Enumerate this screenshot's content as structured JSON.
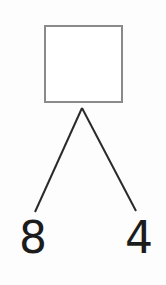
{
  "diagram": {
    "type": "number-bond",
    "whole": "",
    "parts": [
      "8",
      "4"
    ],
    "colors": {
      "box_border": "#8a8a8a",
      "lines": "#2a2a2a",
      "text": "#1c1c1c"
    }
  }
}
